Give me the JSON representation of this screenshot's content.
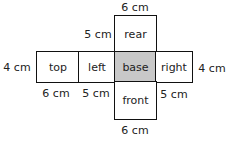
{
  "net": {
    "faces": {
      "rear": "rear",
      "top": "top",
      "left": "left",
      "base": "base",
      "right": "right",
      "front": "front"
    },
    "base_fill": "#c8c8c8",
    "dimensions": {
      "rear_width_top": "6 cm",
      "rear_depth": "5 cm",
      "top_height_left": "4 cm",
      "right_height": "4 cm",
      "top_width": "6 cm",
      "left_width": "5 cm",
      "right_width": "5 cm",
      "front_width_bottom": "6 cm"
    }
  }
}
